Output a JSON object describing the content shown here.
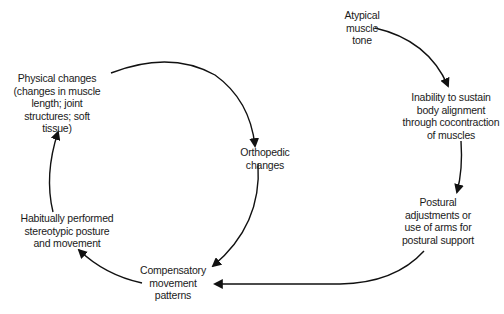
{
  "diagram": {
    "type": "cause-effect cycle",
    "stroke_color": "#111111",
    "background": "#ffffff",
    "nodes": {
      "atypical_tone": {
        "lines": [
          "Atypical",
          "muscle",
          "tone"
        ]
      },
      "inability": {
        "lines": [
          "Inability to sustain",
          "body alignment",
          "through cocontraction",
          "of muscles"
        ]
      },
      "postural": {
        "lines": [
          "Postural",
          "adjustments or",
          "use of arms for",
          "postural support"
        ]
      },
      "compensatory": {
        "lines": [
          "Compensatory",
          "movement",
          "patterns"
        ]
      },
      "habitual": {
        "lines": [
          "Habitually performed",
          "stereotypic posture",
          "and movement"
        ]
      },
      "physical": {
        "lines": [
          "Physical changes",
          "(changes in muscle",
          "length; joint",
          "structures; soft",
          "tissue)"
        ]
      },
      "orthopedic": {
        "lines": [
          "Orthopedic",
          "changes"
        ]
      }
    },
    "edges": [
      {
        "from": "Atypical muscle tone",
        "to": "Inability to sustain body alignment through cocontraction of muscles"
      },
      {
        "from": "Inability to sustain body alignment through cocontraction of muscles",
        "to": "Postural adjustments or use of arms for postural support"
      },
      {
        "from": "Postural adjustments or use of arms for postural support",
        "to": "Compensatory movement patterns"
      },
      {
        "from": "Compensatory movement patterns",
        "to": "Habitually performed stereotypic posture and movement"
      },
      {
        "from": "Habitually performed stereotypic posture and movement",
        "to": "Physical changes (changes in muscle length; joint structures; soft tissue)"
      },
      {
        "from": "Physical changes (changes in muscle length; joint structures; soft tissue)",
        "to": "Orthopedic changes"
      },
      {
        "from": "Orthopedic changes",
        "to": "Compensatory movement patterns"
      }
    ]
  }
}
